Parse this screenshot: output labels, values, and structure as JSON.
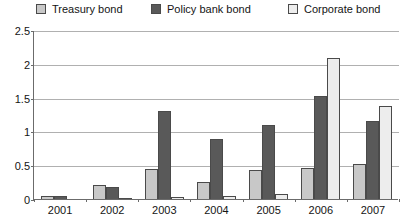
{
  "chart_data": {
    "type": "bar",
    "title": "",
    "xlabel": "",
    "ylabel": "",
    "categories": [
      "2001",
      "2002",
      "2003",
      "2004",
      "2005",
      "2006",
      "2007"
    ],
    "series": [
      {
        "name": "Treasury bond",
        "color": "#c8c8c8",
        "values": [
          0.04,
          0.2,
          0.45,
          0.25,
          0.43,
          0.46,
          0.52
        ]
      },
      {
        "name": "Policy bank bond",
        "color": "#595959",
        "values": [
          0.04,
          0.18,
          1.3,
          0.89,
          1.1,
          1.53,
          1.15
        ]
      },
      {
        "name": "Corporate bond",
        "color": "#ededed",
        "values": [
          0.0,
          0.02,
          0.03,
          0.04,
          0.07,
          2.09,
          1.37
        ]
      }
    ],
    "ylim": [
      0,
      2.5
    ],
    "yticks": [
      "0",
      "0.5",
      "1",
      "1.5",
      "2",
      "2.5"
    ],
    "ytick_values": [
      0,
      0.5,
      1,
      1.5,
      2,
      2.5
    ],
    "grid": true,
    "legend_position": "top"
  },
  "legend": {
    "items": [
      {
        "label": "Treasury bond"
      },
      {
        "label": "Policy bank bond"
      },
      {
        "label": "Corporate bond"
      }
    ]
  },
  "colors": {
    "treasury": "#c8c8c8",
    "policy": "#595959",
    "corporate": "#ededed",
    "bar_border": "#4a4a4a",
    "gridline": "#b0b0b0",
    "axis": "#6b6b6b"
  }
}
